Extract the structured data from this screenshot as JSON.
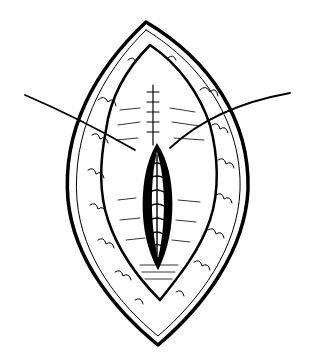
{
  "figure": {
    "type": "line-illustration",
    "colors": {
      "ink": "#000000",
      "background": "#ffffff"
    },
    "parts": [
      "outer-skin-margin",
      "inner-subcutaneous-fat-edge",
      "muscle-fascia-layer",
      "central-sutured-incision",
      "suture-thread-left",
      "suture-thread-right"
    ]
  }
}
